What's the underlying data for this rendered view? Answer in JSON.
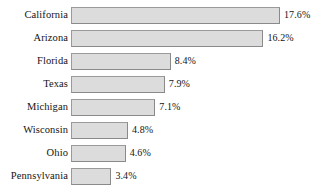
{
  "chart_data": {
    "type": "bar",
    "orientation": "horizontal",
    "title": "",
    "subtitle": "",
    "xlabel": "",
    "ylabel": "",
    "grid": false,
    "legend": null,
    "axis_visible": false,
    "xlim": [
      0,
      17.6
    ],
    "value_suffix": "%",
    "categories": [
      "California",
      "Arizona",
      "Florida",
      "Texas",
      "Michigan",
      "Wisconsin",
      "Ohio",
      "Pennsylvania"
    ],
    "values": [
      17.6,
      16.2,
      8.4,
      7.9,
      7.1,
      4.8,
      4.6,
      3.4
    ],
    "value_labels": [
      "17.6%",
      "16.2%",
      "8.4%",
      "7.9%",
      "7.1%",
      "4.8%",
      "4.6%",
      "3.4%"
    ],
    "bar_fill_color": "#dcdcdc",
    "bar_border_color": "#8a8a8a",
    "background_color": "#ffffff",
    "text_color": "#141414"
  },
  "rows": [
    {
      "label": "California",
      "value_label": "17.6%",
      "bar_width_px": 209
    },
    {
      "label": "Arizona",
      "value_label": "16.2%",
      "bar_width_px": 193
    },
    {
      "label": "Florida",
      "value_label": "8.4%",
      "bar_width_px": 101
    },
    {
      "label": "Texas",
      "value_label": "7.9%",
      "bar_width_px": 95
    },
    {
      "label": "Michigan",
      "value_label": "7.1%",
      "bar_width_px": 86
    },
    {
      "label": "Wisconsin",
      "value_label": "4.8%",
      "bar_width_px": 58
    },
    {
      "label": "Ohio",
      "value_label": "4.6%",
      "bar_width_px": 56
    },
    {
      "label": "Pennsylvania",
      "value_label": "3.4%",
      "bar_width_px": 42
    }
  ]
}
